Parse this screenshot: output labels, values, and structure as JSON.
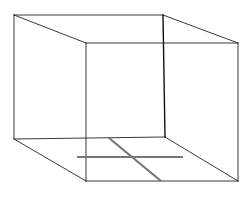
{
  "diagram": {
    "title": "",
    "colors": {
      "background": "#ffffff",
      "edge": "#222222",
      "back_edge_dark": "#111111",
      "floor_lines": "#777777"
    },
    "vertices": {
      "back_top_left": [
        14,
        15
      ],
      "back_top_right": [
        163,
        15
      ],
      "back_bottom_left": [
        14,
        139
      ],
      "back_bottom_right": [
        165,
        137
      ],
      "front_top_left": [
        86,
        43
      ],
      "front_top_right": [
        238,
        43
      ],
      "front_bottom_left": [
        86,
        181
      ],
      "front_bottom_right": [
        238,
        181
      ]
    },
    "floor_lines": [
      {
        "name": "horizontal",
        "from": [
          77,
          157
        ],
        "to": [
          183,
          157
        ]
      },
      {
        "name": "diagonal",
        "from": [
          109,
          138
        ],
        "to": [
          161,
          181
        ]
      }
    ]
  }
}
